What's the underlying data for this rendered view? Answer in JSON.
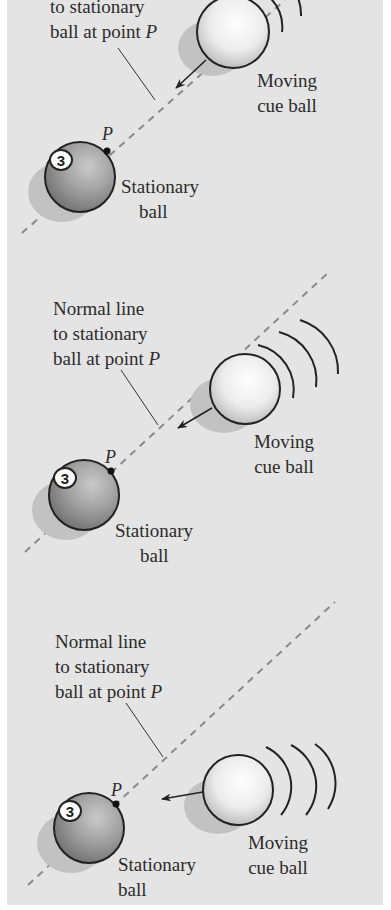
{
  "figure": {
    "colors": {
      "background": "#e4e4e4",
      "border": "#ffffff",
      "stationary_ball": "#9a9a9a",
      "cue_ball": "#f4f4f4",
      "outline": "#222222",
      "dashed_line": "#8a8a8a",
      "text": "#2b2b2b"
    },
    "panels": [
      {
        "normal_label": {
          "line1": "",
          "line2": "to stationary",
          "line3_prefix": "ball at point ",
          "line3_var": "P"
        },
        "point_label": "P",
        "ball_number": "3",
        "stationary_label": {
          "line1": "Stationary",
          "line2": "ball"
        },
        "moving_label": {
          "line1": "Moving",
          "line2": "cue ball"
        }
      },
      {
        "normal_label": {
          "line1": "Normal line",
          "line2": "to stationary",
          "line3_prefix": "ball at point ",
          "line3_var": "P"
        },
        "point_label": "P",
        "ball_number": "3",
        "stationary_label": {
          "line1": "Stationary",
          "line2": "ball"
        },
        "moving_label": {
          "line1": "Moving",
          "line2": "cue ball"
        }
      },
      {
        "normal_label": {
          "line1": "Normal line",
          "line2": "to stationary",
          "line3_prefix": "ball at point ",
          "line3_var": "P"
        },
        "point_label": "P",
        "ball_number": "3",
        "stationary_label": {
          "line1": "Stationary",
          "line2": "ball"
        },
        "moving_label": {
          "line1": "Moving",
          "line2": "cue ball"
        }
      }
    ]
  }
}
